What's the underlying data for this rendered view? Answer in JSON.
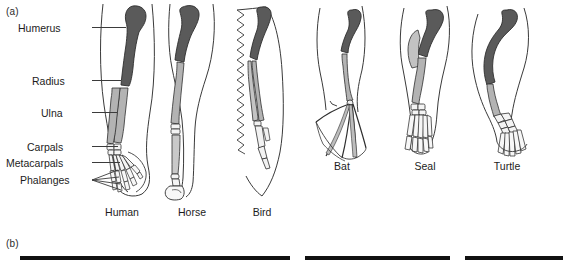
{
  "figure": {
    "panel_a_letter": "(a)",
    "panel_b_letter": "(b)"
  },
  "bone_labels": [
    {
      "name": "humerus",
      "text": "Humerus",
      "x": 18,
      "y": 22,
      "label_right": 92,
      "leader_y": 27,
      "leader_to": 126
    },
    {
      "name": "radius",
      "text": "Radius",
      "x": 32,
      "y": 75,
      "label_right": 92,
      "leader_y": 80,
      "leader_to": 120
    },
    {
      "name": "ulna",
      "text": "Ulna",
      "x": 41,
      "y": 107,
      "label_right": 92,
      "leader_y": 112,
      "leader_to": 120
    },
    {
      "name": "carpals",
      "text": "Carpals",
      "x": 27,
      "y": 142,
      "label_right": 92,
      "leader_y": 147,
      "leader_to": 118
    },
    {
      "name": "metacarpals",
      "text": "Metacarpals",
      "x": 8,
      "y": 158,
      "label_right": 92,
      "leader_y": 163,
      "leader_to": 120
    },
    {
      "name": "phalanges",
      "text": "Phalanges",
      "x": 20,
      "y": 175,
      "label_right": 92,
      "leader_y": 180,
      "leader_to": 110
    }
  ],
  "species": [
    {
      "name": "human",
      "label": "Human",
      "cx": 122,
      "y": 207
    },
    {
      "name": "horse",
      "label": "Horse",
      "cx": 192,
      "y": 207
    },
    {
      "name": "bird",
      "label": "Bird",
      "cx": 262,
      "y": 207
    },
    {
      "name": "bat",
      "label": "Bat",
      "cx": 342,
      "y": 161
    },
    {
      "name": "seal",
      "label": "Seal",
      "cx": 425,
      "y": 161
    },
    {
      "name": "turtle",
      "label": "Turtle",
      "cx": 507,
      "y": 161
    }
  ],
  "colors": {
    "humerus_fill": "#5a5a5a",
    "forearm_fill": "#b3b3b3",
    "hand_fill": "#f2f2f2",
    "outline": "#2e2e2e",
    "body_outline": "#3a3a3a",
    "bar_fill": "#111111"
  },
  "panel_b_bars": [
    {
      "name": "bar-left",
      "x": 20,
      "width": 270,
      "y": 256,
      "height": 4
    },
    {
      "name": "bar-middle",
      "x": 305,
      "width": 145,
      "y": 256,
      "height": 4
    },
    {
      "name": "bar-right",
      "x": 465,
      "width": 98,
      "y": 256,
      "height": 4
    }
  ]
}
